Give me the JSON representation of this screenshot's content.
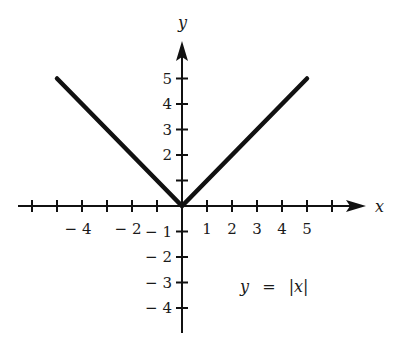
{
  "chart_data": {
    "type": "line",
    "title": "",
    "equation_label": "y = |x|",
    "equation_parts": {
      "lhs": "y",
      "eq": "=",
      "rhs": "|x|"
    },
    "xlabel": "x",
    "ylabel": "y",
    "xlim": [
      -6.5,
      7
    ],
    "ylim": [
      -5,
      7
    ],
    "grid": false,
    "x_ticks": [
      -6,
      -5,
      -4,
      -3,
      -2,
      -1,
      1,
      2,
      3,
      4,
      5,
      6
    ],
    "x_tick_labels": [
      {
        "value": -4,
        "text": "− 4"
      },
      {
        "value": -2,
        "text": "− 2"
      },
      {
        "value": 1,
        "text": "1"
      },
      {
        "value": 2,
        "text": "2"
      },
      {
        "value": 3,
        "text": "3"
      },
      {
        "value": 4,
        "text": "4"
      },
      {
        "value": 5,
        "text": "5"
      }
    ],
    "y_ticks": [
      -4,
      -3,
      -2,
      -1,
      1,
      2,
      3,
      4,
      5
    ],
    "y_tick_labels": [
      {
        "value": 5,
        "text": "5"
      },
      {
        "value": 4,
        "text": "4"
      },
      {
        "value": 3,
        "text": "3"
      },
      {
        "value": 2,
        "text": "2"
      },
      {
        "value": -1,
        "text": "− 1"
      },
      {
        "value": -2,
        "text": "− 2"
      },
      {
        "value": -3,
        "text": "− 3"
      },
      {
        "value": -4,
        "text": "− 4"
      }
    ],
    "series": [
      {
        "name": "y = |x|",
        "x": [
          -5,
          -4,
          -3,
          -2,
          -1,
          0,
          1,
          2,
          3,
          4,
          5
        ],
        "y": [
          5,
          4,
          3,
          2,
          1,
          0,
          1,
          2,
          3,
          4,
          5
        ]
      }
    ],
    "colors": {
      "line": "#111111",
      "axis": "#111111",
      "text": "#1a1a1a"
    }
  }
}
